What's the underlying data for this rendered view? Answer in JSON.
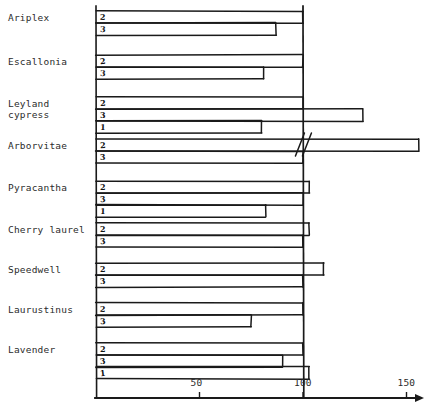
{
  "chart_data": {
    "type": "bar",
    "orientation": "horizontal",
    "title": "",
    "xlabel": "",
    "ylabel": "",
    "xlim": [
      0,
      150
    ],
    "xticks": [
      50,
      100,
      150
    ],
    "xtick_labels": [
      "50",
      "100",
      "150"
    ],
    "grid": false,
    "reference_line": 100,
    "legend": null,
    "note": "Hand-drawn horizontal bar chart; bars labelled 1, 2, 3 within each plant group. Arborvitae bar 2 is drawn with an axis-break symbol indicating a value beyond the plotted range.",
    "categories": [
      "Ariplex",
      "Escallonia",
      "Leyland cypress",
      "Arborvitae",
      "Pyracantha",
      "Cherry laurel",
      "Speedwell",
      "Laurustinus",
      "Lavender"
    ],
    "groups": [
      {
        "category": "Ariplex",
        "bars": [
          {
            "label": "2",
            "value": 100
          },
          {
            "label": "3",
            "value": 87
          }
        ]
      },
      {
        "category": "Escallonia",
        "bars": [
          {
            "label": "2",
            "value": 100
          },
          {
            "label": "3",
            "value": 81
          }
        ]
      },
      {
        "category": "Leyland cypress",
        "bars": [
          {
            "label": "2",
            "value": 100
          },
          {
            "label": "3",
            "value": 129
          },
          {
            "label": "1",
            "value": 80
          }
        ]
      },
      {
        "category": "Arborvitae",
        "bars": [
          {
            "label": "2",
            "value": 156,
            "broken": true
          },
          {
            "label": "3",
            "value": 100
          }
        ]
      },
      {
        "category": "Pyracantha",
        "bars": [
          {
            "label": "2",
            "value": 103
          },
          {
            "label": "3",
            "value": 100
          },
          {
            "label": "1",
            "value": 82
          }
        ]
      },
      {
        "category": "Cherry laurel",
        "bars": [
          {
            "label": "2",
            "value": 103
          },
          {
            "label": "3",
            "value": 100
          }
        ]
      },
      {
        "category": "Speedwell",
        "bars": [
          {
            "label": "2",
            "value": 110
          },
          {
            "label": "3",
            "value": 100
          }
        ]
      },
      {
        "category": "Laurustinus",
        "bars": [
          {
            "label": "2",
            "value": 100
          },
          {
            "label": "3",
            "value": 75
          }
        ]
      },
      {
        "category": "Lavender",
        "bars": [
          {
            "label": "2",
            "value": 100
          },
          {
            "label": "3",
            "value": 90
          },
          {
            "label": "1",
            "value": 103
          }
        ]
      }
    ]
  },
  "geometry": {
    "x0": 96,
    "px_per_unit": 2.07,
    "axis_y": 398,
    "axis_x_end": 424,
    "plot_top": 8,
    "label_x": 8,
    "bar_height": 12,
    "rows": [
      {
        "category": "Ariplex",
        "label_y": 12,
        "bars_y": [
          11,
          23
        ]
      },
      {
        "category": "Escallonia",
        "label_y": 56,
        "bars_y": [
          55,
          67
        ]
      },
      {
        "category": "Leyland cypress",
        "label_y": 98,
        "bars_y": [
          97,
          109,
          121
        ]
      },
      {
        "category": "Arborvitae",
        "label_y": 140,
        "bars_y": [
          139,
          151
        ]
      },
      {
        "category": "Pyracantha",
        "label_y": 182,
        "bars_y": [
          181,
          193,
          205
        ]
      },
      {
        "category": "Cherry laurel",
        "label_y": 224,
        "bars_y": [
          223,
          235
        ]
      },
      {
        "category": "Speedwell",
        "label_y": 264,
        "bars_y": [
          263,
          275
        ]
      },
      {
        "category": "Laurustinus",
        "label_y": 304,
        "bars_y": [
          303,
          315
        ]
      },
      {
        "category": "Lavender",
        "label_y": 344,
        "bars_y": [
          343,
          355,
          367
        ]
      }
    ]
  },
  "colors": {
    "ink": "#1a1a1a",
    "label_ink": "#2b2b2b",
    "background": "#ffffff"
  }
}
